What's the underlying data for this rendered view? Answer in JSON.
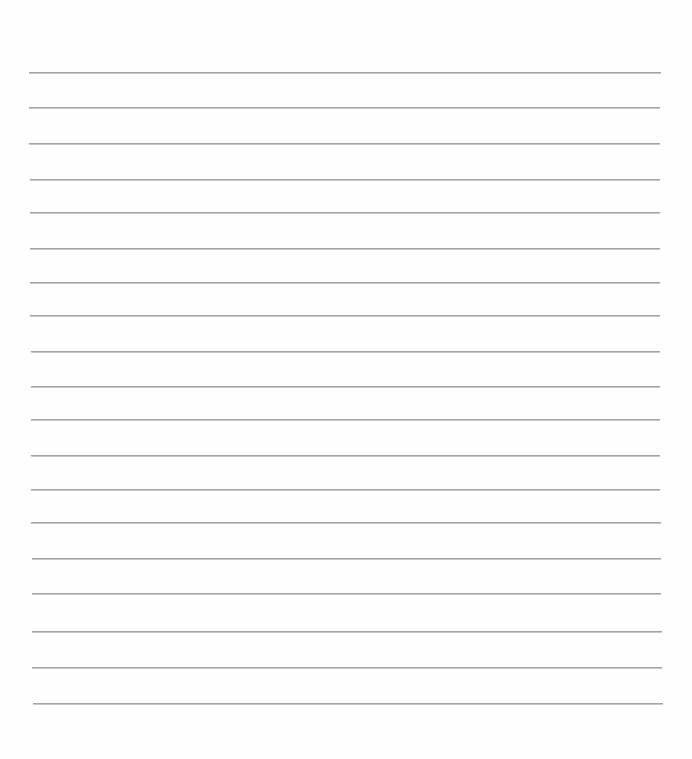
{
  "page": {
    "type": "lined-paper",
    "background_color": "#fefefe",
    "line_color": "#a3a3a3",
    "line_count": 19,
    "text": ""
  },
  "lines": [
    {
      "y": 72,
      "x1": 29,
      "x2": 661
    },
    {
      "y": 107,
      "x1": 29,
      "x2": 660
    },
    {
      "y": 143,
      "x1": 29,
      "x2": 660
    },
    {
      "y": 179,
      "x1": 30,
      "x2": 660
    },
    {
      "y": 212,
      "x1": 30,
      "x2": 660
    },
    {
      "y": 248,
      "x1": 30,
      "x2": 660
    },
    {
      "y": 282,
      "x1": 30,
      "x2": 660
    },
    {
      "y": 315,
      "x1": 30,
      "x2": 660
    },
    {
      "y": 351,
      "x1": 31,
      "x2": 660
    },
    {
      "y": 386,
      "x1": 31,
      "x2": 660
    },
    {
      "y": 419,
      "x1": 31,
      "x2": 660
    },
    {
      "y": 455,
      "x1": 31,
      "x2": 660
    },
    {
      "y": 489,
      "x1": 31,
      "x2": 660
    },
    {
      "y": 522,
      "x1": 31,
      "x2": 661
    },
    {
      "y": 558,
      "x1": 32,
      "x2": 661
    },
    {
      "y": 593,
      "x1": 32,
      "x2": 661
    },
    {
      "y": 631,
      "x1": 32,
      "x2": 662
    },
    {
      "y": 667,
      "x1": 32,
      "x2": 662
    },
    {
      "y": 703,
      "x1": 33,
      "x2": 663
    }
  ]
}
